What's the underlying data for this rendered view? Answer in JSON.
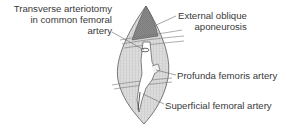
{
  "diagram": {
    "type": "anatomical-illustration",
    "labels": [
      {
        "id": "transverse",
        "lines": [
          "Transverse arteriotomy",
          "in common femoral",
          "artery"
        ]
      },
      {
        "id": "external",
        "lines": [
          "External oblique",
          "aponeurosis"
        ]
      },
      {
        "id": "profunda",
        "lines": [
          "Profunda femoris artery"
        ]
      },
      {
        "id": "superficial",
        "lines": [
          "Superficial femoral artery"
        ]
      }
    ],
    "colors": {
      "background": "#ffffff",
      "tissue_fill": "#d8d8d8",
      "dark_fill": "#8a8a8a",
      "outline": "#555555",
      "label_text": "#3a3a3a",
      "leader_line": "#666666"
    }
  }
}
